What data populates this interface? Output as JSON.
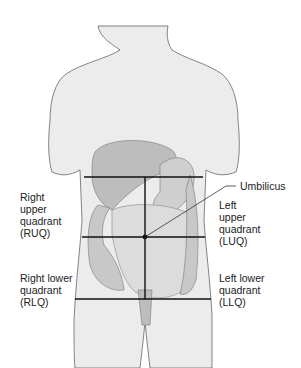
{
  "diagram": {
    "labels": {
      "umbilicus": "Umbilicus",
      "ruq": "Right\nupper\nquadrant\n(RUQ)",
      "luq": "Left\nupper\nquadrant\n(LUQ)",
      "rlq": "Right lower\nquadrant\n(RLQ)",
      "llq": "Left lower\nquadrant\n(LLQ)"
    },
    "colors": {
      "body": "#ececec",
      "outline": "#666666",
      "organ": "#bdbdbd",
      "intestine": "#d6d6d6",
      "lines": "#111111"
    }
  }
}
